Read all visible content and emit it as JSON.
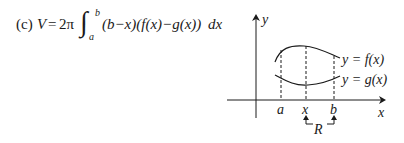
{
  "formula": {
    "part_label": "(c)",
    "lhs": "V",
    "equals": "=",
    "coefficient": "2π",
    "integral_sign": "∫",
    "upper_limit": "b",
    "lower_limit": "a",
    "integrand": "(b−x)(f(x)−g(x))",
    "differential": "dx"
  },
  "diagram": {
    "y_axis_label": "y",
    "x_axis_label": "x",
    "tick_labels": [
      "a",
      "x",
      "b"
    ],
    "curve_labels": {
      "upper": "y = f(x)",
      "lower": "y = g(x)"
    },
    "region_label": "R"
  }
}
